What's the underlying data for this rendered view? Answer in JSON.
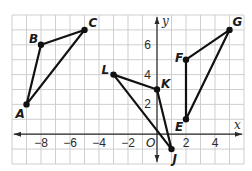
{
  "diagram": {
    "type": "coordinate-plane",
    "grid": {
      "x_min": -10,
      "x_max": 6,
      "y_min": -2,
      "y_max": 8,
      "left_px": 12,
      "top_px": 15,
      "unit_x_px": 14.5,
      "unit_y_px": 14.9
    },
    "axes": {
      "x_label": "x",
      "y_label": "y",
      "origin_label": "O",
      "x_ticks": [
        {
          "value": -8,
          "label": "−8"
        },
        {
          "value": -6,
          "label": "−6"
        },
        {
          "value": -4,
          "label": "−4"
        },
        {
          "value": -2,
          "label": "−2"
        },
        {
          "value": 2,
          "label": "2"
        },
        {
          "value": 4,
          "label": "4"
        }
      ],
      "y_ticks": [
        {
          "value": 2,
          "label": "2"
        },
        {
          "value": 4,
          "label": "4"
        },
        {
          "value": 6,
          "label": "6"
        }
      ]
    },
    "points": {
      "A": {
        "label": "A",
        "x": -9,
        "y": 2,
        "label_dx": -11,
        "label_dy": 14
      },
      "B": {
        "label": "B",
        "x": -8,
        "y": 6,
        "label_dx": -12,
        "label_dy": -2
      },
      "C": {
        "label": "C",
        "x": -5,
        "y": 7,
        "label_dx": 4,
        "label_dy": -3
      },
      "L": {
        "label": "L",
        "x": -3,
        "y": 4,
        "label_dx": -12,
        "label_dy": -1
      },
      "K": {
        "label": "K",
        "x": 0,
        "y": 3,
        "label_dx": 4,
        "label_dy": -2
      },
      "J": {
        "label": "J",
        "x": 1,
        "y": -1,
        "label_dx": 1,
        "label_dy": 14
      },
      "F": {
        "label": "F",
        "x": 2,
        "y": 5,
        "label_dx": -11,
        "label_dy": 2
      },
      "E": {
        "label": "E",
        "x": 2,
        "y": 1,
        "label_dx": -11,
        "label_dy": 12
      },
      "G": {
        "label": "G",
        "x": 5,
        "y": 7,
        "label_dx": 3,
        "label_dy": -4
      }
    },
    "triangles": [
      {
        "name": "ABC",
        "vertices": [
          "A",
          "B",
          "C"
        ]
      },
      {
        "name": "LKJ",
        "vertices": [
          "L",
          "K",
          "J"
        ]
      },
      {
        "name": "FGE",
        "vertices": [
          "F",
          "G",
          "E"
        ]
      }
    ],
    "colors": {
      "line": "#111111",
      "grid": "#c9c9c9",
      "axis": "#2a2a2a"
    }
  }
}
